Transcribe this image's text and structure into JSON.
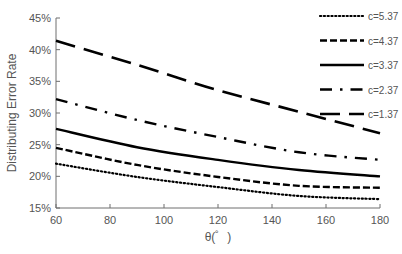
{
  "chart_data": {
    "type": "line",
    "title": "",
    "xlabel": "θ(゜)",
    "ylabel": "Distributing Error Rate",
    "xlim": [
      60,
      180
    ],
    "ylim": [
      0.15,
      0.45
    ],
    "x_ticks": [
      60,
      80,
      100,
      120,
      140,
      160,
      180
    ],
    "y_ticks": [
      "15%",
      "20%",
      "25%",
      "30%",
      "35%",
      "40%",
      "45%"
    ],
    "y_tick_values": [
      0.15,
      0.2,
      0.25,
      0.3,
      0.35,
      0.4,
      0.45
    ],
    "grid": false,
    "legend_position": "top-right",
    "x": [
      60,
      90,
      120,
      150,
      180
    ],
    "series": [
      {
        "name": "c=5.37",
        "style": "dotted",
        "values": [
          0.22,
          0.199,
          0.183,
          0.169,
          0.164
        ]
      },
      {
        "name": "c=4.37",
        "style": "short-dash",
        "values": [
          0.245,
          0.218,
          0.199,
          0.185,
          0.182
        ]
      },
      {
        "name": "c=3.37",
        "style": "solid",
        "values": [
          0.275,
          0.246,
          0.226,
          0.21,
          0.2
        ]
      },
      {
        "name": "c=2.37",
        "style": "dash-dot",
        "values": [
          0.322,
          0.289,
          0.262,
          0.238,
          0.226
        ]
      },
      {
        "name": "c=1.37",
        "style": "long-dash",
        "values": [
          0.414,
          0.376,
          0.336,
          0.302,
          0.268
        ]
      }
    ]
  }
}
